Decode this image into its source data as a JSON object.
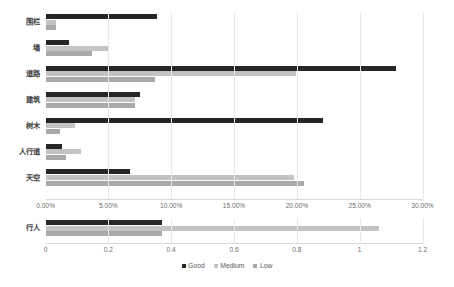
{
  "chart_data": {
    "type": "bar",
    "orientation": "horizontal",
    "title": "",
    "xlabel": "",
    "ylabel": "",
    "grid": false,
    "legend": {
      "position": "bottom",
      "entries": [
        {
          "name": "Good",
          "color": "#262626"
        },
        {
          "name": "Medium",
          "color": "#c3c3c3"
        },
        {
          "name": "Low",
          "color": "#a9a9a9"
        }
      ]
    },
    "panels": [
      {
        "id": "percent-panel",
        "axis_id": "percent-axis",
        "categories": [
          "围栏",
          "墙",
          "道路",
          "建筑",
          "树木",
          "人行道",
          "天空"
        ],
        "series": [
          {
            "name": "Good",
            "color": "#262626",
            "values": [
              8.9,
              1.85,
              27.9,
              7.5,
              22.1,
              1.3,
              6.7
            ]
          },
          {
            "name": "Medium",
            "color": "#c3c3c3",
            "values": [
              0.85,
              4.95,
              19.9,
              7.1,
              2.35,
              2.85,
              19.8
            ]
          },
          {
            "name": "Low",
            "color": "#a9a9a9",
            "values": [
              0.85,
              3.7,
              8.7,
              7.1,
              1.15,
              1.6,
              20.6
            ]
          }
        ],
        "axis": {
          "min": 0,
          "max": 30,
          "step": 5,
          "tick_labels": [
            "0.00%",
            "5.00%",
            "10.00%",
            "15.00%",
            "20.00%",
            "25.00%",
            "30.00%"
          ],
          "tick_values": [
            0,
            5,
            10,
            15,
            20,
            25,
            30
          ]
        }
      },
      {
        "id": "count-panel",
        "axis_id": "count-axis",
        "categories": [
          "行人"
        ],
        "series": [
          {
            "name": "Good",
            "color": "#262626",
            "values": [
              0.37
            ]
          },
          {
            "name": "Medium",
            "color": "#c3c3c3",
            "values": [
              1.06
            ]
          },
          {
            "name": "Low",
            "color": "#a9a9a9",
            "values": [
              0.37
            ]
          }
        ],
        "axis": {
          "min": 0,
          "max": 1.2,
          "step": 0.2,
          "tick_labels": [
            "0",
            "0.2",
            "0.4",
            "0.6",
            "0.8",
            "1",
            "1.2"
          ],
          "tick_values": [
            0,
            0.2,
            0.4,
            0.6,
            0.8,
            1,
            1.2
          ]
        }
      }
    ]
  },
  "colors": {
    "good": "#262626",
    "medium": "#c3c3c3",
    "low": "#a9a9a9",
    "axis": "#d9d9d9",
    "text": "#595959",
    "background": "#ffffff"
  }
}
